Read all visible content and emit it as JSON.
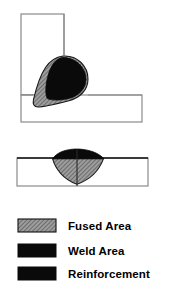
{
  "figure": {
    "title": ""
  },
  "colors": {
    "outline": "#8a8a8a",
    "outline_dark": "#000000",
    "weld_area": "#0a0a0a",
    "reinforcement": "#0a0a0a",
    "fused_area_base": "#9a9a9a",
    "fused_area_hatch": "#4a4a4a",
    "background": "#ffffff",
    "text": "#000000"
  },
  "tee_joint": {
    "name": "tee-joint-cross-section",
    "vertical_plate": {
      "x": 21,
      "y": 14,
      "width": 43,
      "height": 81
    },
    "horizontal_plate": {
      "x": 21,
      "y": 95,
      "width": 121,
      "height": 27
    },
    "weld_bead": {
      "fused_outline": "M 63,56 C 77,55 88,66 88,79 C 88,90 80,98 68,101 C 56,104 44,106 38,106 C 34,106 33,103 34,99 C 36,89 40,76 45,68 C 50,60 56,57 63,56 Z",
      "weld_core": "M 63,57 C 76,57 86,67 86,79 C 86,89 78,97 67,99 C 58,101 50,101 47,99 C 45,96 45,88 47,78 C 50,66 55,58 63,57 Z"
    }
  },
  "butt_joint": {
    "name": "butt-joint-cross-section",
    "plate": {
      "x": 17,
      "y": 158,
      "width": 131,
      "height": 28
    },
    "seam_line": {
      "x": 77,
      "y1": 158,
      "y2": 186
    },
    "fused_area": "M 53,159 C 56,170 64,180 77,184 C 90,180 99,170 103,159 Z",
    "reinforcement": "M 53,159 C 57,153 64,150 72,149 C 82,148 93,151 99,155 C 101,156 103,158 104,159 Z"
  },
  "legend": {
    "name": "weld-zone-legend",
    "items": [
      {
        "label": "Fused Area",
        "swatch": "hatched",
        "swatch_name": "fused-area-swatch"
      },
      {
        "label": "Weld Area",
        "swatch": "solid-black",
        "swatch_name": "weld-area-swatch"
      },
      {
        "label": "Reinforcement",
        "swatch": "solid-black",
        "swatch_name": "reinforcement-swatch"
      }
    ],
    "swatch_x": 18,
    "swatch_width": 38,
    "swatch_height": 13,
    "label_x": 68,
    "rows_y": [
      219,
      245,
      268
    ]
  }
}
